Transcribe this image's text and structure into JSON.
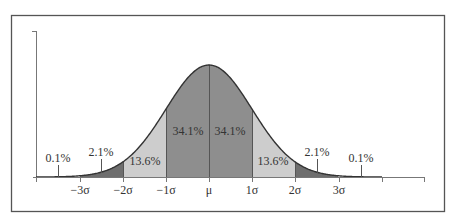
{
  "chart_data": {
    "type": "area",
    "title": "",
    "xlabel": "",
    "ylabel": "",
    "x_ticks": [
      "−3σ",
      "−2σ",
      "−1σ",
      "μ",
      "1σ",
      "2σ",
      "3σ"
    ],
    "x_tick_values": [
      -3,
      -2,
      -1,
      0,
      1,
      2,
      3
    ],
    "xlim": [
      -4,
      5
    ],
    "regions": [
      {
        "from": "-inf",
        "to": -3,
        "percent": "0.1%",
        "shade": "none"
      },
      {
        "from": -3,
        "to": -2,
        "percent": "2.1%",
        "shade": "#6e6e6e"
      },
      {
        "from": -2,
        "to": -1,
        "percent": "13.6%",
        "shade": "#cdcdcd"
      },
      {
        "from": -1,
        "to": 0,
        "percent": "34.1%",
        "shade": "#8e8e8e"
      },
      {
        "from": 0,
        "to": 1,
        "percent": "34.1%",
        "shade": "#8e8e8e"
      },
      {
        "from": 1,
        "to": 2,
        "percent": "13.6%",
        "shade": "#cdcdcd"
      },
      {
        "from": 2,
        "to": 3,
        "percent": "2.1%",
        "shade": "#6e6e6e"
      },
      {
        "from": 3,
        "to": "inf",
        "percent": "0.1%",
        "shade": "none"
      }
    ],
    "labels": {
      "left_tail": "0.1%",
      "left_2sd": "2.1%",
      "left_1sd": "13.6%",
      "left_center": "34.1%",
      "right_center": "34.1%",
      "right_1sd": "13.6%",
      "right_2sd": "2.1%",
      "right_tail": "0.1%"
    },
    "grid": false,
    "legend": "none"
  },
  "colors": {
    "frame": "#555555",
    "curve": "#333333",
    "center_band": "#8e8e8e",
    "one_sd_band": "#cdcdcd",
    "two_sd_band": "#6e6e6e",
    "axis": "#777777"
  }
}
